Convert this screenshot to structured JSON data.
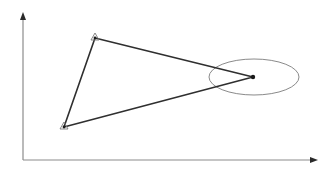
{
  "diagram": {
    "width": 335,
    "height": 178,
    "background": "#ffffff",
    "axes": {
      "color": "#8c8c8c",
      "arrow_color": "#2a2a2a",
      "origin": [
        23,
        160
      ],
      "y_axis_top": [
        23,
        12
      ],
      "x_axis_end": [
        318,
        160
      ]
    },
    "triangle": {
      "stroke": "#2f2f2f",
      "stroke_width": 1.6,
      "vertices": [
        [
          95,
          38
        ],
        [
          64,
          127
        ],
        [
          253,
          77
        ]
      ]
    },
    "markers": {
      "triangle_marker_color": "#7a7a7a",
      "dot_color": "#1a1a1a",
      "triangle_markers": [
        [
          95,
          38
        ],
        [
          64,
          127
        ]
      ],
      "dot": [
        253,
        77
      ]
    },
    "ellipse": {
      "cx": 254,
      "cy": 77,
      "rx": 45,
      "ry": 18,
      "stroke": "#8a8a8a",
      "stroke_width": 1
    }
  }
}
